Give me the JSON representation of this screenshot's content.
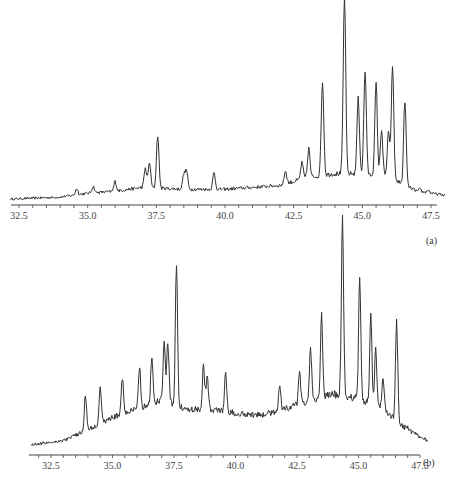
{
  "chart_data": [
    {
      "type": "line",
      "panel_label": "(a)",
      "xlabel": "",
      "ylabel": "",
      "xlim": [
        32.2,
        48.0
      ],
      "x_ticks": [
        "32.5",
        "35.0",
        "37.5",
        "40.0",
        "42.5",
        "45.0",
        "47.5"
      ],
      "grid": false,
      "legend": "none",
      "baseline_points": [
        [
          32.2,
          0.01
        ],
        [
          34.0,
          0.02
        ],
        [
          35.0,
          0.04
        ],
        [
          36.0,
          0.05
        ],
        [
          37.0,
          0.07
        ],
        [
          38.5,
          0.06
        ],
        [
          40.0,
          0.06
        ],
        [
          42.0,
          0.08
        ],
        [
          43.0,
          0.12
        ],
        [
          44.0,
          0.14
        ],
        [
          45.0,
          0.14
        ],
        [
          46.0,
          0.12
        ],
        [
          47.0,
          0.05
        ],
        [
          48.0,
          0.03
        ]
      ],
      "peaks": [
        {
          "x": 34.6,
          "h": 0.05
        },
        {
          "x": 35.2,
          "h": 0.06
        },
        {
          "x": 36.0,
          "h": 0.08
        },
        {
          "x": 37.1,
          "h": 0.14
        },
        {
          "x": 37.25,
          "h": 0.17
        },
        {
          "x": 37.55,
          "h": 0.31
        },
        {
          "x": 38.5,
          "h": 0.11
        },
        {
          "x": 38.6,
          "h": 0.13
        },
        {
          "x": 39.6,
          "h": 0.12
        },
        {
          "x": 42.2,
          "h": 0.12
        },
        {
          "x": 42.8,
          "h": 0.15
        },
        {
          "x": 43.05,
          "h": 0.22
        },
        {
          "x": 43.55,
          "h": 0.56
        },
        {
          "x": 44.35,
          "h": 1.0
        },
        {
          "x": 44.85,
          "h": 0.47
        },
        {
          "x": 45.1,
          "h": 0.61
        },
        {
          "x": 45.5,
          "h": 0.55
        },
        {
          "x": 45.7,
          "h": 0.32
        },
        {
          "x": 45.95,
          "h": 0.3
        },
        {
          "x": 46.1,
          "h": 0.65
        },
        {
          "x": 46.55,
          "h": 0.48
        },
        {
          "x": 47.1,
          "h": 0.04
        },
        {
          "x": 47.4,
          "h": 0.04
        }
      ]
    },
    {
      "type": "line",
      "panel_label": "(b)",
      "xlabel": "",
      "ylabel": "",
      "xlim": [
        31.7,
        47.8
      ],
      "x_ticks": [
        "32.5",
        "35.0",
        "37.5",
        "40.0",
        "42.5",
        "45.0",
        "47.5"
      ],
      "grid": false,
      "legend": "none",
      "baseline_points": [
        [
          31.7,
          0.03
        ],
        [
          33.0,
          0.05
        ],
        [
          34.0,
          0.1
        ],
        [
          35.0,
          0.16
        ],
        [
          36.0,
          0.2
        ],
        [
          37.0,
          0.24
        ],
        [
          38.0,
          0.2
        ],
        [
          39.0,
          0.2
        ],
        [
          40.0,
          0.18
        ],
        [
          41.0,
          0.17
        ],
        [
          42.0,
          0.2
        ],
        [
          43.0,
          0.24
        ],
        [
          44.0,
          0.27
        ],
        [
          45.0,
          0.25
        ],
        [
          46.0,
          0.2
        ],
        [
          47.0,
          0.1
        ],
        [
          47.8,
          0.05
        ]
      ],
      "peaks": [
        {
          "x": 33.9,
          "h": 0.23
        },
        {
          "x": 34.5,
          "h": 0.26
        },
        {
          "x": 35.4,
          "h": 0.28
        },
        {
          "x": 36.1,
          "h": 0.32
        },
        {
          "x": 36.6,
          "h": 0.36
        },
        {
          "x": 37.1,
          "h": 0.42
        },
        {
          "x": 37.25,
          "h": 0.42
        },
        {
          "x": 37.6,
          "h": 0.79
        },
        {
          "x": 38.7,
          "h": 0.33
        },
        {
          "x": 38.85,
          "h": 0.29
        },
        {
          "x": 39.6,
          "h": 0.3
        },
        {
          "x": 41.8,
          "h": 0.24
        },
        {
          "x": 42.6,
          "h": 0.28
        },
        {
          "x": 43.05,
          "h": 0.38
        },
        {
          "x": 43.5,
          "h": 0.55
        },
        {
          "x": 44.35,
          "h": 1.0
        },
        {
          "x": 45.05,
          "h": 0.72
        },
        {
          "x": 45.5,
          "h": 0.56
        },
        {
          "x": 45.7,
          "h": 0.4
        },
        {
          "x": 46.0,
          "h": 0.27
        },
        {
          "x": 46.55,
          "h": 0.56
        },
        {
          "x": 47.0,
          "h": 0.07
        }
      ]
    }
  ],
  "figure": {
    "panel_a_label": "(a)",
    "panel_b_label": "(b)",
    "line_color": "#333333",
    "axis_color": "#444444"
  }
}
